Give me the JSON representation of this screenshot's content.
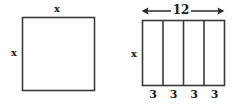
{
  "figure": {
    "type": "geometry-diagram",
    "background_color": "#ffffff",
    "stroke_color": "#3a3a3a",
    "text_color": "#1a1a1a"
  },
  "square_figure": {
    "name": "square",
    "top_label": "x",
    "left_label": "x",
    "geometry": {
      "x": 22,
      "y": 17,
      "width": 72,
      "height": 73
    }
  },
  "rectangle_figure": {
    "name": "divided-rectangle",
    "dimension_label": "12",
    "left_label": "x",
    "segment_labels": [
      "3",
      "3",
      "3",
      "3"
    ],
    "segment_count": 4,
    "geometry": {
      "x": 142,
      "y": 20,
      "width": 82,
      "height": 65
    },
    "dimension_arrow": {
      "y": 11,
      "x1": 142,
      "x2": 224
    }
  }
}
